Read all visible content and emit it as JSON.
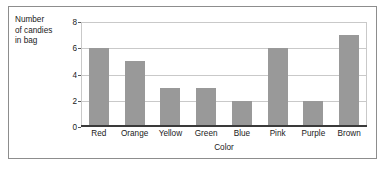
{
  "chart_data": {
    "type": "bar",
    "title": "",
    "xlabel": "Color",
    "ylabel": "Number of candies in bag",
    "ylabel_lines": [
      "Number",
      "of candies",
      "in bag"
    ],
    "categories": [
      "Red",
      "Orange",
      "Yellow",
      "Green",
      "Blue",
      "Pink",
      "Purple",
      "Brown"
    ],
    "values": [
      6,
      5,
      3,
      3,
      2,
      6,
      2,
      7
    ],
    "ylim": [
      0,
      8
    ],
    "yticks": [
      0,
      2,
      4,
      6,
      8
    ],
    "grid": true,
    "legend": false,
    "bar_color": "#999999",
    "grid_color": "#c9c9c9",
    "axis_color": "#3a3a3a",
    "border_color": "#8d8d8d"
  }
}
